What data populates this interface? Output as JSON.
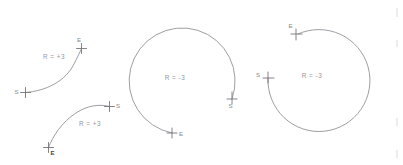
{
  "diagram": {
    "background_color": "#ffffff",
    "stroke_color": "#8d8d92",
    "label_color": "#96969c",
    "figures": [
      {
        "id": "arc-positive-1",
        "radius_label": "R = +3",
        "radius_value": "+3",
        "start_label": "S",
        "end_label": "E",
        "sweep": "minor-arc",
        "label_x": 54,
        "label_y": 59,
        "start_x": 25,
        "start_y": 92,
        "end_x": 82,
        "end_y": 48,
        "path": "M 25.5 92.5 C 45 91 66 82 75 62 C 78 56 80 52 81.5 48.5"
      },
      {
        "id": "arc-positive-2",
        "radius_label": "R = +3",
        "radius_value": "+3",
        "start_label": "S",
        "end_label": "E",
        "sweep": "minor-arc",
        "label_x": 90,
        "label_y": 126,
        "start_x": 110,
        "start_y": 106,
        "end_x": 48,
        "end_y": 148,
        "path": "M 109.5 106.5 C 100 104 88 105 76 113 C 62 122 53 136 48.5 147.5"
      },
      {
        "id": "arc-negative-middle",
        "radius_label": "R = -3",
        "radius_value": "-3",
        "start_label": "S",
        "end_label": "E",
        "sweep": "major-arc",
        "label_x": 175,
        "label_y": 80,
        "start_x": 232,
        "start_y": 99,
        "end_x": 172,
        "end_y": 133,
        "center_x": 182,
        "center_y": 76,
        "radius_px": 53,
        "path": "M 232 99 A 53 53 0 1 0 172 133"
      },
      {
        "id": "arc-negative-right",
        "radius_label": "R = -3",
        "radius_value": "-3",
        "start_label": "S",
        "end_label": "E",
        "sweep": "major-arc",
        "label_x": 312,
        "label_y": 78,
        "start_x": 268,
        "start_y": 78,
        "end_x": 298,
        "end_y": 34,
        "center_x": 319,
        "center_y": 83,
        "radius_px": 51,
        "path": "M 268 78 A 51 51 0 1 0 298 34"
      }
    ],
    "edge_artifacts": [
      {
        "x": 396,
        "y": 8,
        "w": 2,
        "h": 9
      },
      {
        "x": 396,
        "y": 40,
        "w": 2,
        "h": 7
      },
      {
        "x": 396,
        "y": 118,
        "w": 2,
        "h": 8
      },
      {
        "x": 396,
        "y": 150,
        "w": 2,
        "h": 8
      }
    ]
  }
}
